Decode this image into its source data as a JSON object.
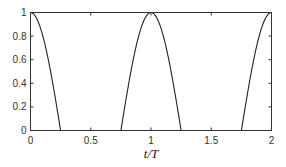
{
  "chart_data": {
    "type": "line",
    "title": "",
    "xlabel": "t/T",
    "ylabel": "",
    "xlim": [
      0,
      2
    ],
    "ylim": [
      0,
      1
    ],
    "xticks": [
      "0",
      "0.5",
      "1",
      "1.5",
      "2"
    ],
    "yticks": [
      "0",
      "0.2",
      "0.4",
      "0.6",
      "0.8",
      "1"
    ],
    "grid": false,
    "legend": null,
    "series": [
      {
        "name": "max(0, cos(2πt/T))",
        "x": [
          0,
          0.05,
          0.1,
          0.15,
          0.2,
          0.25,
          0.5,
          0.75,
          0.8,
          0.85,
          0.9,
          0.95,
          1.0,
          1.05,
          1.1,
          1.15,
          1.2,
          1.25,
          1.5,
          1.75,
          1.8,
          1.85,
          1.9,
          1.95,
          2.0
        ],
        "values": [
          1,
          0.95,
          0.81,
          0.59,
          0.31,
          0,
          0,
          0,
          0.31,
          0.59,
          0.81,
          0.95,
          1,
          0.95,
          0.81,
          0.59,
          0.31,
          0,
          0,
          0,
          0.31,
          0.59,
          0.81,
          0.95,
          1
        ]
      }
    ]
  }
}
